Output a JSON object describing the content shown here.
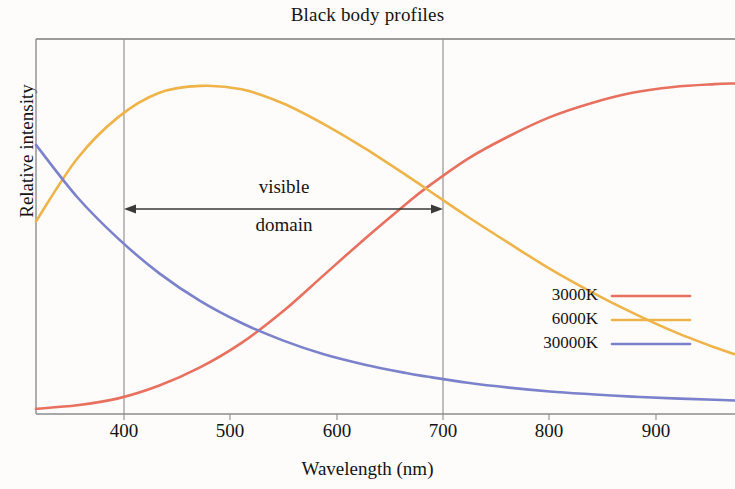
{
  "chart_data": {
    "type": "line",
    "title": "Black body profiles",
    "xlabel": "Wavelength (nm)",
    "ylabel": "Relative intensity",
    "xlim": [
      320,
      1000
    ],
    "ylim": [
      0,
      1.08
    ],
    "xticks": [
      400,
      500,
      600,
      700,
      800,
      900
    ],
    "xticklabels": [
      "400",
      "500",
      "600",
      "700",
      "800",
      "900"
    ],
    "yticks": [],
    "yticklabels": [],
    "grid": false,
    "legend_position": "center-right",
    "series": [
      {
        "name": "3000K",
        "color": "#e8705f",
        "x": [
          320,
          360,
          400,
          440,
          480,
          520,
          560,
          600,
          640,
          680,
          700,
          740,
          780,
          820,
          860,
          900,
          940,
          980,
          1000
        ],
        "y": [
          0.015,
          0.025,
          0.045,
          0.082,
          0.135,
          0.205,
          0.295,
          0.4,
          0.505,
          0.605,
          0.652,
          0.735,
          0.8,
          0.855,
          0.895,
          0.925,
          0.942,
          0.95,
          0.952
        ]
      },
      {
        "name": "6000K",
        "color": "#eeb44a",
        "x": [
          320,
          360,
          400,
          440,
          480,
          520,
          560,
          600,
          640,
          680,
          700,
          740,
          780,
          820,
          860,
          900,
          940,
          980,
          1000
        ],
        "y": [
          0.555,
          0.735,
          0.855,
          0.925,
          0.945,
          0.935,
          0.895,
          0.835,
          0.765,
          0.688,
          0.648,
          0.568,
          0.492,
          0.418,
          0.352,
          0.292,
          0.238,
          0.192,
          0.172
        ]
      },
      {
        "name": "30000K",
        "color": "#7b82cb",
        "x": [
          320,
          360,
          400,
          440,
          480,
          520,
          560,
          600,
          640,
          680,
          700,
          740,
          780,
          820,
          860,
          900,
          940,
          980,
          1000
        ],
        "y": [
          0.775,
          0.625,
          0.505,
          0.405,
          0.325,
          0.262,
          0.212,
          0.172,
          0.142,
          0.118,
          0.108,
          0.09,
          0.076,
          0.065,
          0.057,
          0.05,
          0.045,
          0.041,
          0.039
        ]
      }
    ],
    "annotations": [
      {
        "name": "visible-domain",
        "text_above": "visible",
        "text_below": "domain",
        "arrow_from": 400,
        "arrow_to": 700,
        "style": "double-headed-arrow"
      }
    ],
    "vertical_markers": [
      400,
      700
    ]
  },
  "legend": {
    "entries": [
      {
        "label": "3000K",
        "color": "#e8705f"
      },
      {
        "label": "6000K",
        "color": "#eeb44a"
      },
      {
        "label": "30000K",
        "color": "#7b82cb"
      }
    ]
  },
  "colors": {
    "axis": "#6e6e6e",
    "marker_line": "#8a8a8a",
    "arrow": "#3a3a3a",
    "background": "#fdfcfb",
    "text": "#141414"
  }
}
